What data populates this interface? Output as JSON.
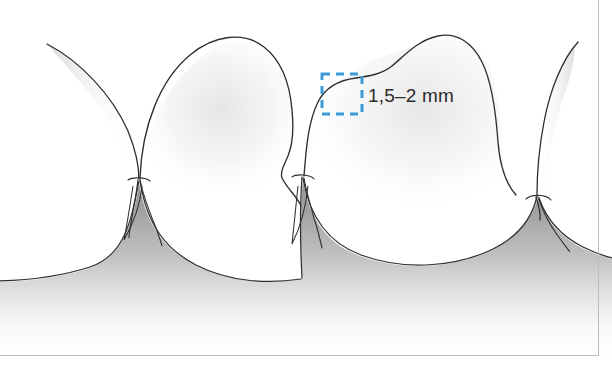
{
  "figure": {
    "kind": "dental-anatomy-illustration",
    "background_color": "#ffffff",
    "border_color": "#b9b9b9"
  },
  "annotation": {
    "measurement_label": "1,5–2 mm",
    "callout_shape": "dashed-square",
    "callout_color": "#3b9bd8",
    "callout_dash": "8 6",
    "callout_x": 322,
    "callout_y": 74,
    "callout_width": 40,
    "callout_height": 40
  },
  "drawing": {
    "outline_color": "#2f2f2f",
    "gingiva_fill_top": "#9a9a9a",
    "gingiva_fill_bottom": "#ffffff",
    "enamel_shade_color": "#d8d8d8",
    "teeth": [
      {
        "name": "tooth-left-incisor",
        "position": "left"
      },
      {
        "name": "tooth-center-incisor",
        "position": "center"
      },
      {
        "name": "tooth-right-incisor",
        "position": "right"
      }
    ],
    "papillae": [
      {
        "name": "papilla-left",
        "apex_x": 139,
        "apex_y": 178
      },
      {
        "name": "papilla-center",
        "apex_x": 302,
        "apex_y": 175
      },
      {
        "name": "papilla-right",
        "apex_x": 538,
        "apex_y": 196
      }
    ],
    "gingiva_label": "gingiva"
  }
}
